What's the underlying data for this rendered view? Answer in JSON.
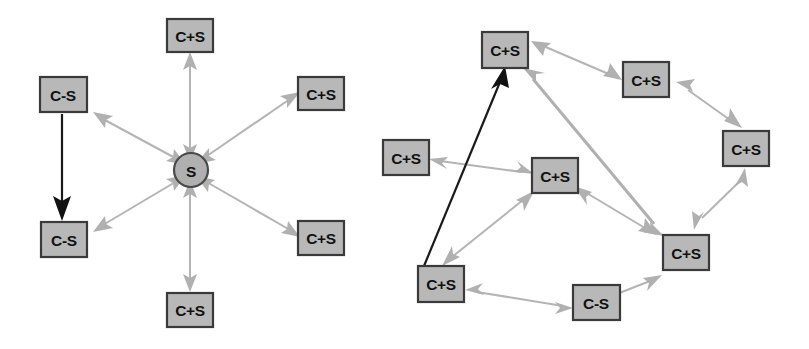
{
  "figure": {
    "background_color": "#ffffff",
    "node_fill_color": "#b8b8b8",
    "node_border_color": "#3a3a3a",
    "edge_color": "#b4b4b4",
    "highlight_edge_color": "#111111",
    "label_color": "#111111"
  },
  "diagrams": [
    {
      "id": "left-diagram",
      "name": "star-topology-diagram",
      "layout": "star",
      "hub": {
        "id": "L-hub",
        "label": "S",
        "shape": "circle",
        "cx": 191,
        "cy": 170,
        "r": 17
      },
      "nodes": [
        {
          "id": "L1",
          "label": "C+S",
          "shape": "rect",
          "x": 167,
          "y": 19,
          "w": 46,
          "h": 33
        },
        {
          "id": "L2",
          "label": "C+S",
          "shape": "rect",
          "x": 298,
          "y": 77,
          "w": 46,
          "h": 33
        },
        {
          "id": "L3",
          "label": "C+S",
          "shape": "rect",
          "x": 298,
          "y": 221,
          "w": 46,
          "h": 34
        },
        {
          "id": "L4",
          "label": "C+S",
          "shape": "rect",
          "x": 167,
          "y": 293,
          "w": 46,
          "h": 34
        },
        {
          "id": "L5",
          "label": "C-S",
          "shape": "rect",
          "x": 41,
          "y": 222,
          "w": 46,
          "h": 35
        },
        {
          "id": "L6",
          "label": "C-S",
          "shape": "rect",
          "x": 40,
          "y": 77,
          "w": 47,
          "h": 35
        }
      ],
      "edges": [
        {
          "from": "L-hub",
          "to": "L1",
          "style": "double-arrow",
          "color": "gray"
        },
        {
          "from": "L-hub",
          "to": "L2",
          "style": "double-arrow",
          "color": "gray"
        },
        {
          "from": "L-hub",
          "to": "L3",
          "style": "double-arrow",
          "color": "gray"
        },
        {
          "from": "L-hub",
          "to": "L4",
          "style": "double-arrow",
          "color": "gray"
        },
        {
          "from": "L-hub",
          "to": "L5",
          "style": "double-arrow",
          "color": "gray"
        },
        {
          "from": "L-hub",
          "to": "L6",
          "style": "double-arrow",
          "color": "gray"
        },
        {
          "from": "L6",
          "to": "L5",
          "style": "single-arrow",
          "color": "black"
        }
      ]
    },
    {
      "id": "right-diagram",
      "name": "ring-topology-diagram",
      "layout": "ring",
      "nodes": [
        {
          "id": "R1",
          "label": "C+S",
          "shape": "rect",
          "x": 482,
          "y": 32,
          "w": 46,
          "h": 36
        },
        {
          "id": "R2",
          "label": "C+S",
          "shape": "rect",
          "x": 623,
          "y": 62,
          "w": 46,
          "h": 35
        },
        {
          "id": "R3",
          "label": "C+S",
          "shape": "rect",
          "x": 723,
          "y": 131,
          "w": 46,
          "h": 35
        },
        {
          "id": "R4",
          "label": "C+S",
          "shape": "rect",
          "x": 663,
          "y": 235,
          "w": 46,
          "h": 35
        },
        {
          "id": "R5",
          "label": "C-S",
          "shape": "rect",
          "x": 573,
          "y": 285,
          "w": 47,
          "h": 35
        },
        {
          "id": "R6",
          "label": "C+S",
          "shape": "rect",
          "x": 418,
          "y": 266,
          "w": 46,
          "h": 36
        },
        {
          "id": "R7",
          "label": "C+S",
          "shape": "rect",
          "x": 532,
          "y": 158,
          "w": 46,
          "h": 35
        },
        {
          "id": "R8",
          "label": "C+S",
          "shape": "rect",
          "x": 383,
          "y": 140,
          "w": 46,
          "h": 35
        }
      ],
      "edges": [
        {
          "from": "R1",
          "to": "R2",
          "style": "double-arrow",
          "color": "gray"
        },
        {
          "from": "R2",
          "to": "R3",
          "style": "double-arrow",
          "color": "gray"
        },
        {
          "from": "R3",
          "to": "R4",
          "style": "double-arrow",
          "color": "gray"
        },
        {
          "from": "R4",
          "to": "R5",
          "style": "double-arrow",
          "color": "gray"
        },
        {
          "from": "R5",
          "to": "R6",
          "style": "double-arrow",
          "color": "gray"
        },
        {
          "from": "R6",
          "to": "R7",
          "style": "double-arrow",
          "color": "gray"
        },
        {
          "from": "R7",
          "to": "R4",
          "style": "double-arrow",
          "color": "gray"
        },
        {
          "from": "R8",
          "to": "R7",
          "style": "double-arrow",
          "color": "gray"
        },
        {
          "from": "R1",
          "to": "R4",
          "style": "double-arrow",
          "color": "gray"
        },
        {
          "from": "R6",
          "to": "R1",
          "style": "single-arrow",
          "color": "black"
        }
      ]
    }
  ],
  "labels": {
    "client_server": "C+S",
    "client_only": "C-S",
    "server_only": "S"
  }
}
